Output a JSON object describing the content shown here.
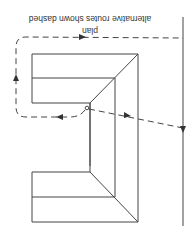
{
  "diagram": {
    "orientation": "rotated 180 degrees",
    "caption": "plan",
    "note": "alternative routes shown dashed",
    "elements": {
      "building": "L-shaped (U-shaped) building with inner walls and mitred corners",
      "main_route": "dashed line crossing diagonally to the right boundary line",
      "alternative_route": "dashed line looping around the outside of the building",
      "boundary": "solid vertical line on the right"
    },
    "colors": {
      "line": "#444444",
      "background": "#ffffff"
    }
  }
}
